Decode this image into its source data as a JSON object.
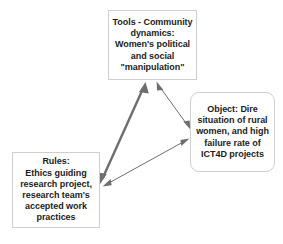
{
  "diagram": {
    "type": "activity-theory-triangle",
    "background_color": "#ffffff",
    "node_border_color": "#cfcfcf",
    "arrow_color": "#6e6e6e",
    "text_color": "#1c1c1c",
    "nodes": [
      {
        "id": "tools",
        "label": "Tools - Community dynamics:\nWomen's political and social \"manipulation\"",
        "title": "Tools - Community dynamics:",
        "shape": "rectangle"
      },
      {
        "id": "object",
        "label": "Object: Dire situation of rural women, and high failure rate of ICT4D projects",
        "title": "Object: Dire",
        "shape": "rounded-rectangle"
      },
      {
        "id": "rules",
        "label": "Rules:\nEthics guiding research project, research team's accepted work practices",
        "title": "Rules:",
        "shape": "rectangle"
      }
    ],
    "edges": [
      {
        "id": "tools-rules",
        "from": "tools",
        "to": "rules",
        "style": "double-headed",
        "weight": "thick"
      },
      {
        "id": "tools-object",
        "from": "tools",
        "to": "object",
        "style": "double-headed",
        "weight": "thin"
      },
      {
        "id": "rules-object",
        "from": "rules",
        "to": "object",
        "style": "double-headed",
        "weight": "thin"
      }
    ]
  }
}
